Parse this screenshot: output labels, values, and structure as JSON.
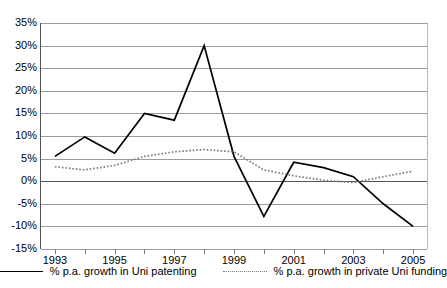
{
  "chart_data": {
    "type": "line",
    "title": "",
    "xlabel": "",
    "ylabel": "",
    "grid": true,
    "legend_position": "bottom",
    "ylim": [
      -15,
      35
    ],
    "ytick_step": 5,
    "ytick_labels": [
      "35%",
      "30%",
      "25%",
      "20%",
      "15%",
      "10%",
      "5%",
      "0%",
      "-5%",
      "-10%",
      "-15%"
    ],
    "ytick_values": [
      35,
      30,
      25,
      20,
      15,
      10,
      5,
      0,
      -5,
      -10,
      -15
    ],
    "x": [
      1993,
      1994,
      1995,
      1996,
      1997,
      1998,
      1999,
      2000,
      2001,
      2002,
      2003,
      2004,
      2005
    ],
    "xtick_labels": [
      "1993",
      "1995",
      "1997",
      "1999",
      "2001",
      "2003",
      "2005"
    ],
    "xtick_values": [
      1993,
      1995,
      1997,
      1999,
      2001,
      2003,
      2005
    ],
    "series": [
      {
        "name": "% p.a. growth in Uni patenting",
        "style": "solid",
        "color": "#000000",
        "values": [
          5.5,
          9.8,
          6.2,
          15.0,
          13.5,
          30.0,
          5.5,
          -7.8,
          4.2,
          3.0,
          1.0,
          -5.0,
          -10.0
        ]
      },
      {
        "name": "% p.a. growth in private Uni funding",
        "style": "dotted",
        "color": "#7a7a7a",
        "values": [
          3.2,
          2.5,
          3.5,
          5.5,
          6.5,
          7.0,
          6.5,
          2.5,
          1.2,
          0.2,
          -0.3,
          1.0,
          2.2
        ]
      }
    ]
  },
  "legend": {
    "items": [
      {
        "label": "% p.a. growth in Uni patenting",
        "swatch": "solid-line-swatch"
      },
      {
        "label": "% p.a. growth in private Uni funding",
        "swatch": "dotted-line-swatch"
      }
    ]
  }
}
